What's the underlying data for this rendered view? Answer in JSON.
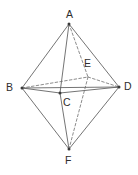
{
  "figure": {
    "background_color": "#ffffff",
    "solid_edge_color": "#5b5b5b",
    "dashed_edge_color": "#6e6e6e",
    "label_color": "#2e2e2e",
    "width": 138,
    "height": 175
  },
  "vertices": [
    {
      "id": "A",
      "label": "A",
      "x": 69,
      "y": 24,
      "label_x": 66,
      "label_y": 9,
      "hidden": false
    },
    {
      "id": "B",
      "label": "B",
      "x": 22,
      "y": 88,
      "label_x": 6,
      "label_y": 82,
      "hidden": false
    },
    {
      "id": "C",
      "label": "C",
      "x": 60,
      "y": 93,
      "label_x": 63,
      "label_y": 97,
      "hidden": false
    },
    {
      "id": "D",
      "label": "D",
      "x": 119,
      "y": 87,
      "label_x": 124,
      "label_y": 81,
      "hidden": false
    },
    {
      "id": "E",
      "label": "E",
      "x": 88,
      "y": 77,
      "label_x": 84,
      "label_y": 58,
      "hidden": true
    },
    {
      "id": "F",
      "label": "F",
      "x": 69,
      "y": 149,
      "label_x": 65,
      "label_y": 155,
      "hidden": false
    }
  ],
  "edges": [
    {
      "from": "A",
      "to": "B",
      "style": "solid"
    },
    {
      "from": "A",
      "to": "D",
      "style": "solid"
    },
    {
      "from": "A",
      "to": "C",
      "style": "solid"
    },
    {
      "from": "A",
      "to": "E",
      "style": "dashed"
    },
    {
      "from": "B",
      "to": "D",
      "style": "solid"
    },
    {
      "from": "B",
      "to": "C",
      "style": "solid"
    },
    {
      "from": "B",
      "to": "F",
      "style": "solid"
    },
    {
      "from": "B",
      "to": "E",
      "style": "dashed"
    },
    {
      "from": "C",
      "to": "D",
      "style": "solid"
    },
    {
      "from": "C",
      "to": "F",
      "style": "solid"
    },
    {
      "from": "D",
      "to": "F",
      "style": "solid"
    },
    {
      "from": "E",
      "to": "D",
      "style": "dashed"
    },
    {
      "from": "E",
      "to": "F",
      "style": "dashed"
    }
  ]
}
